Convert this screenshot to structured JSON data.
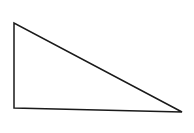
{
  "diagram": {
    "shape": "right-triangle",
    "vertices": [
      [
        14,
        23
      ],
      [
        14,
        108
      ],
      [
        182,
        112
      ]
    ],
    "stroke_color": "#1a1a1a",
    "fill_color": "#ffffff",
    "stroke_width": 1.5
  }
}
